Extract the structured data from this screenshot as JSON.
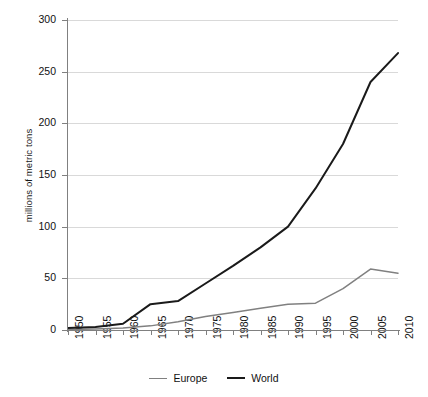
{
  "chart_data": {
    "type": "line",
    "title": "",
    "xlabel": "",
    "ylabel": "millions of metric tons",
    "xlim": [
      1950,
      2010
    ],
    "ylim": [
      0,
      300
    ],
    "yticks": [
      0,
      50,
      100,
      150,
      200,
      250,
      300
    ],
    "ytick_labels": [
      "0",
      "50",
      "100",
      "150",
      "200",
      "250",
      "300"
    ],
    "grid": "horizontal",
    "legend_position": "bottom-center",
    "categories": [
      1950,
      1955,
      1960,
      1965,
      1970,
      1975,
      1980,
      1985,
      1990,
      1995,
      2000,
      2005,
      2010
    ],
    "xtick_labels": [
      "1950",
      "1955",
      "1960",
      "1965",
      "1970",
      "1975",
      "1980",
      "1985",
      "1990",
      "1995",
      "2000",
      "2005",
      "2010"
    ],
    "series": [
      {
        "name": "Europe",
        "color": "#808080",
        "values": [
          0.5,
          1,
          2,
          4,
          8,
          13,
          17,
          21,
          25,
          26,
          40,
          59,
          55
        ]
      },
      {
        "name": "World",
        "color": "#1a1a1a",
        "values": [
          2,
          3,
          6,
          25,
          28,
          45,
          62,
          80,
          100,
          137,
          180,
          240,
          268
        ]
      }
    ],
    "legend": [
      {
        "label": "Europe",
        "color": "#808080",
        "swatch": "line-swatch-europe"
      },
      {
        "label": "World",
        "color": "#1a1a1a",
        "swatch": "line-swatch-world"
      }
    ]
  }
}
